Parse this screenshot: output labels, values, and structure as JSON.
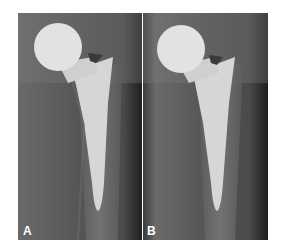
{
  "figure": {
    "panels": [
      {
        "label": "A",
        "description": "hip-prosthesis-radiograph"
      },
      {
        "label": "B",
        "description": "hip-prosthesis-radiograph"
      }
    ]
  },
  "colors": {
    "background": "#ffffff",
    "xray_dark": "#2f2f2f",
    "xray_mid": "#5a5a5a",
    "implant": "#d9d9d9",
    "label": "#ffffff"
  }
}
